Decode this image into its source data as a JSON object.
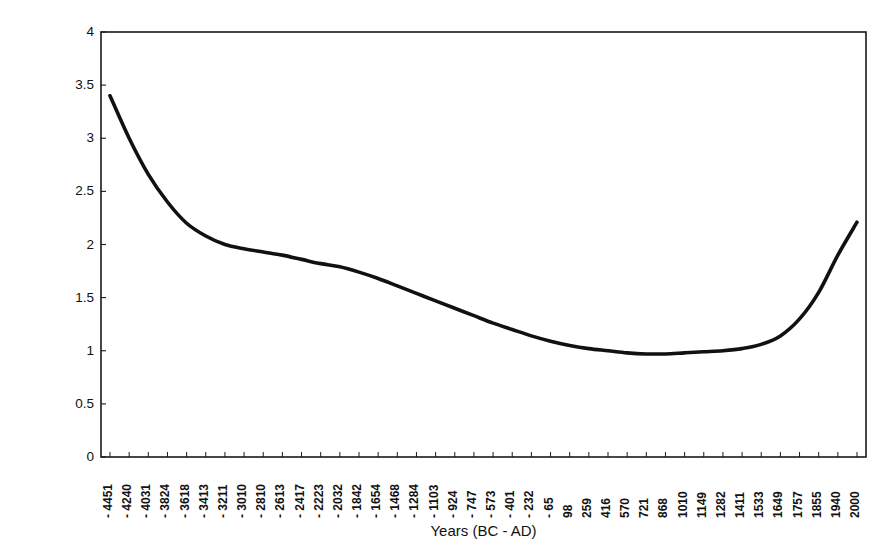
{
  "chart_data": {
    "type": "line",
    "title": "",
    "xlabel": "Years (BC - AD)",
    "ylabel": "Arboreal/NonArboreal Pollen %",
    "ylim": [
      0,
      4
    ],
    "ytick_labels": [
      "0",
      "0.5",
      "1",
      "1.5",
      "2",
      "2.5",
      "3",
      "3.5",
      "4"
    ],
    "ytick_values": [
      0,
      0.5,
      1,
      1.5,
      2,
      2.5,
      3,
      3.5,
      4
    ],
    "grid": false,
    "legend": null,
    "line_color": "#111111",
    "frame_color": "#1a1a1a",
    "background": "#ffffff",
    "categories": [
      "-4451",
      "-4240",
      "-4031",
      "-3824",
      "-3618",
      "-3413",
      "-3211",
      "-3010",
      "-2810",
      "-2613",
      "-2417",
      "-2223",
      "-2032",
      "-1842",
      "-1654",
      "-1468",
      "-1284",
      "-1103",
      "-924",
      "-747",
      "-573",
      "-401",
      "-232",
      "-65",
      "98",
      "259",
      "416",
      "570",
      "721",
      "868",
      "1010",
      "1149",
      "1282",
      "1411",
      "1533",
      "1649",
      "1757",
      "1855",
      "1940",
      "2000"
    ],
    "series": [
      {
        "name": "Arboreal/NonArboreal Pollen %",
        "values": [
          3.4,
          3.0,
          2.66,
          2.4,
          2.2,
          2.08,
          2.0,
          1.96,
          1.93,
          1.9,
          1.86,
          1.82,
          1.79,
          1.74,
          1.68,
          1.61,
          1.54,
          1.47,
          1.4,
          1.33,
          1.26,
          1.2,
          1.14,
          1.09,
          1.05,
          1.02,
          1.0,
          0.98,
          0.97,
          0.97,
          0.98,
          0.99,
          1.0,
          1.02,
          1.06,
          1.14,
          1.3,
          1.55,
          1.9,
          2.21
        ]
      }
    ]
  }
}
